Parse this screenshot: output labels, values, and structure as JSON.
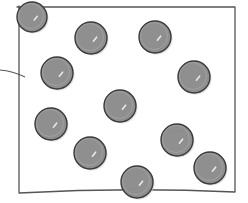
{
  "figure": {
    "colors": {
      "background": "#ffffff",
      "box_stroke": "#555555",
      "sphere_fill": "#8f8f8f",
      "sphere_stroke": "#3a3a3a",
      "highlight": "#e8e8e8"
    },
    "box": {
      "left": 19,
      "top": 7,
      "right": 235,
      "bottom": 193
    },
    "lead_line": {
      "x1": 0,
      "y1": 70,
      "x2": 25,
      "y2": 77
    },
    "spheres": [
      {
        "cx": 32,
        "cy": 17,
        "r": 15
      },
      {
        "cx": 91,
        "cy": 38,
        "r": 16
      },
      {
        "cx": 155,
        "cy": 37,
        "r": 16
      },
      {
        "cx": 57,
        "cy": 73,
        "r": 16
      },
      {
        "cx": 194,
        "cy": 77,
        "r": 16
      },
      {
        "cx": 120,
        "cy": 106,
        "r": 16
      },
      {
        "cx": 51,
        "cy": 124,
        "r": 16
      },
      {
        "cx": 90,
        "cy": 153,
        "r": 16
      },
      {
        "cx": 177,
        "cy": 140,
        "r": 16
      },
      {
        "cx": 210,
        "cy": 168,
        "r": 16
      },
      {
        "cx": 137,
        "cy": 182,
        "r": 16
      }
    ]
  }
}
